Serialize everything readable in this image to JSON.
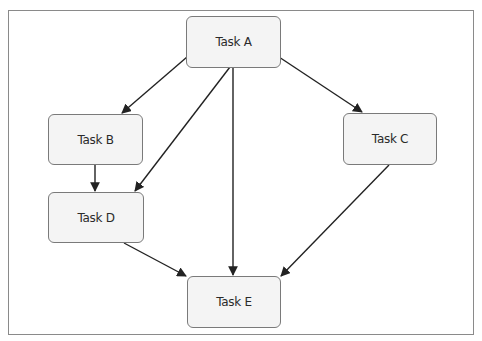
{
  "diagram": {
    "type": "dependency-graph",
    "colors": {
      "node_fill": "#f4f4f4",
      "node_border": "#7a7a7a",
      "edge": "#222222",
      "frame": "#8a8a8a"
    },
    "nodes": [
      {
        "id": "A",
        "label": "Task A"
      },
      {
        "id": "B",
        "label": "Task B"
      },
      {
        "id": "C",
        "label": "Task C"
      },
      {
        "id": "D",
        "label": "Task D"
      },
      {
        "id": "E",
        "label": "Task E"
      }
    ],
    "edges": [
      {
        "from": "A",
        "to": "B"
      },
      {
        "from": "A",
        "to": "D"
      },
      {
        "from": "A",
        "to": "E"
      },
      {
        "from": "A",
        "to": "C"
      },
      {
        "from": "B",
        "to": "D"
      },
      {
        "from": "D",
        "to": "E"
      },
      {
        "from": "C",
        "to": "E"
      }
    ]
  }
}
